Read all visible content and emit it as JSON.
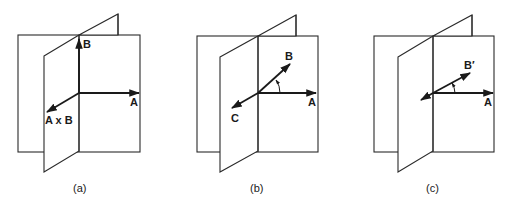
{
  "panels": [
    {
      "id": "a",
      "caption": "(a)",
      "vectors": [
        {
          "name": "A",
          "label": "A"
        },
        {
          "name": "B",
          "label": "B"
        },
        {
          "name": "AxB",
          "label": "A x B"
        }
      ],
      "angle_arc": false
    },
    {
      "id": "b",
      "caption": "(b)",
      "vectors": [
        {
          "name": "A",
          "label": "A"
        },
        {
          "name": "B",
          "label": "B"
        },
        {
          "name": "C",
          "label": "C"
        }
      ],
      "angle_arc": true
    },
    {
      "id": "c",
      "caption": "(c)",
      "vectors": [
        {
          "name": "A",
          "label": "A"
        },
        {
          "name": "B-prime",
          "label": "B′"
        },
        {
          "name": "back",
          "label": ""
        }
      ],
      "angle_arc": true
    }
  ]
}
